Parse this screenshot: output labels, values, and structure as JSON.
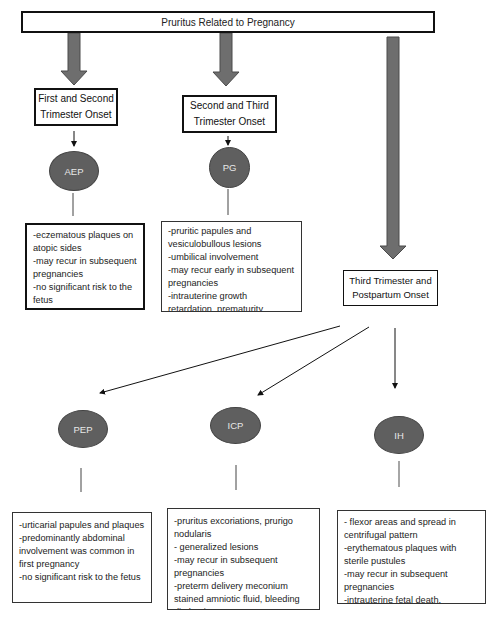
{
  "title": "Pruritus Related to Pregnancy",
  "colors": {
    "arrow_fill": "#6e6e6e",
    "arrow_stroke": "#4a4a4a",
    "ellipse_fill": "#5f5f5f",
    "ellipse_text": "#e8e8e8",
    "border": "#111111",
    "background": "#ffffff"
  },
  "onset_groups": [
    {
      "label_line1": "First and Second",
      "label_line2": "Trimester Onset",
      "conditions": [
        {
          "abbr": "AEP",
          "features": [
            "-eczematous plaques on atopic sides",
            "-may recur in subsequent pregnancies",
            "-no significant risk to the fetus"
          ]
        }
      ]
    },
    {
      "label_line1": "Second and Third",
      "label_line2": "Trimester Onset",
      "conditions": [
        {
          "abbr": "PG",
          "features": [
            "-pruritic papules and vesiculobullous lesions",
            "-umbilical involvement",
            "-may recur early in subsequent pregnancies",
            "-intrauterine growth retardation, prematurity"
          ]
        }
      ]
    },
    {
      "label_line1": "Third Trimester and",
      "label_line2": "Postpartum Onset",
      "conditions": [
        {
          "abbr": "PEP",
          "features": [
            "-urticarial papules and plaques",
            "-predominantly abdominal involvement was common in first pregnancy",
            "-no significant risk to the fetus"
          ]
        },
        {
          "abbr": "ICP",
          "features": [
            "-pruritus excoriations, prurigo nodularis",
            "- generalized lesions",
            "-may recur in subsequent pregnancies",
            "-preterm delivery meconium stained amniotic fluid, bleeding diathesis"
          ]
        },
        {
          "abbr": "IH",
          "features": [
            "- flexor areas and spread in centrifugal pattern",
            "-erythematous plaques with sterile pustules",
            "-may recur in subsequent pregnancies",
            "-intrauterine fetal death, placental ischemia"
          ]
        }
      ]
    }
  ]
}
